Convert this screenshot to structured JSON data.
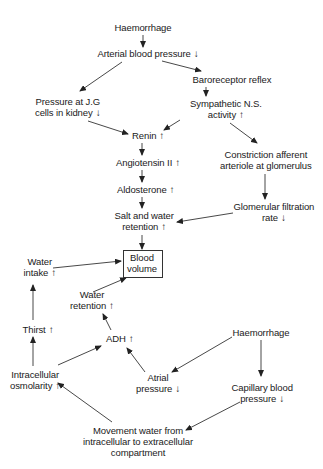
{
  "diagram": {
    "title": "",
    "nodes": {
      "haemorrhage_top": {
        "lines": [
          "Haemorrhage"
        ],
        "indicator": ""
      },
      "arterial_bp": {
        "lines": [
          "Arterial blood pressure"
        ],
        "indicator": "↓"
      },
      "baroreceptor": {
        "lines": [
          "Baroreceptor reflex"
        ],
        "indicator": ""
      },
      "jg_pressure": {
        "lines": [
          "Pressure at J.G",
          "cells in kidney"
        ],
        "indicator": "↓"
      },
      "sympathetic": {
        "lines": [
          "Sympathetic N.S.",
          "activity"
        ],
        "indicator": "↑"
      },
      "renin": {
        "lines": [
          "Renin"
        ],
        "indicator": "↑"
      },
      "angiotensin": {
        "lines": [
          "Angiotensin II"
        ],
        "indicator": "↑"
      },
      "constriction": {
        "lines": [
          "Constriction afferent",
          "arteriole at glomerulus"
        ],
        "indicator": ""
      },
      "aldosterone": {
        "lines": [
          "Aldosterone"
        ],
        "indicator": "↑"
      },
      "gfr": {
        "lines": [
          "Glomerular filtration",
          "rate"
        ],
        "indicator": "↓"
      },
      "salt_water": {
        "lines": [
          "Salt and water",
          "retention"
        ],
        "indicator": "↑"
      },
      "blood_volume": {
        "lines": [
          "Blood",
          "volume"
        ],
        "indicator": ""
      },
      "water_intake": {
        "lines": [
          "Water",
          "intake"
        ],
        "indicator": "↑"
      },
      "water_retention": {
        "lines": [
          "Water",
          "retention"
        ],
        "indicator": "↑"
      },
      "thirst": {
        "lines": [
          "Thirst"
        ],
        "indicator": "↑"
      },
      "adh": {
        "lines": [
          "ADH"
        ],
        "indicator": "↑"
      },
      "haemorrhage_bottom": {
        "lines": [
          "Haemorrhage"
        ],
        "indicator": ""
      },
      "intracellular_osm": {
        "lines": [
          "Intracellular",
          "osmolarity"
        ],
        "indicator": "↑"
      },
      "atrial_pressure": {
        "lines": [
          "Atrial",
          "pressure"
        ],
        "indicator": "↓"
      },
      "capillary_bp": {
        "lines": [
          "Capillary blood",
          "pressure"
        ],
        "indicator": "↓"
      },
      "movement_water": {
        "lines": [
          "Movement water from",
          "intracellular to extracellular",
          "compartment"
        ],
        "indicator": ""
      }
    },
    "edges": [
      [
        "haemorrhage_top",
        "arterial_bp"
      ],
      [
        "arterial_bp",
        "baroreceptor"
      ],
      [
        "arterial_bp",
        "jg_pressure"
      ],
      [
        "baroreceptor",
        "sympathetic"
      ],
      [
        "jg_pressure",
        "renin"
      ],
      [
        "sympathetic",
        "renin"
      ],
      [
        "sympathetic",
        "constriction"
      ],
      [
        "renin",
        "angiotensin"
      ],
      [
        "angiotensin",
        "aldosterone"
      ],
      [
        "aldosterone",
        "salt_water"
      ],
      [
        "constriction",
        "gfr"
      ],
      [
        "gfr",
        "salt_water"
      ],
      [
        "salt_water",
        "blood_volume"
      ],
      [
        "water_intake",
        "blood_volume"
      ],
      [
        "water_retention",
        "blood_volume"
      ],
      [
        "thirst",
        "water_intake"
      ],
      [
        "adh",
        "water_retention"
      ],
      [
        "intracellular_osm",
        "thirst"
      ],
      [
        "intracellular_osm",
        "adh"
      ],
      [
        "atrial_pressure",
        "adh"
      ],
      [
        "haemorrhage_bottom",
        "atrial_pressure"
      ],
      [
        "haemorrhage_bottom",
        "capillary_bp"
      ],
      [
        "capillary_bp",
        "movement_water"
      ],
      [
        "movement_water",
        "intracellular_osm"
      ]
    ]
  }
}
